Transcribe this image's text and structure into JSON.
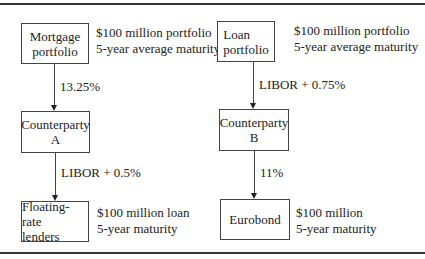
{
  "left": {
    "top_box": "Mortgage\nportfolio",
    "top_box_lines": [
      "Mortgage",
      "portfolio"
    ],
    "top_note": [
      "$100 million portfolio",
      "5-year average maturity"
    ],
    "arrow1_label": "13.25%",
    "mid_box_lines": [
      "Counterparty",
      "A"
    ],
    "arrow2_label": "LIBOR + 0.5%",
    "bottom_box_lines": [
      "Floating-rate",
      "lenders"
    ],
    "bottom_note": [
      "$100 million loan",
      "5-year maturity"
    ]
  },
  "right": {
    "top_box_lines": [
      "Loan",
      "portfolio"
    ],
    "top_note": [
      "$100 million portfolio",
      "5-year average maturity"
    ],
    "arrow1_label": "LIBOR + 0.75%",
    "mid_box_lines": [
      "Counterparty",
      "B"
    ],
    "arrow2_label": "11%",
    "bottom_box_lines": [
      "Eurobond"
    ],
    "bottom_note": [
      "$100 million",
      "5-year maturity"
    ]
  }
}
